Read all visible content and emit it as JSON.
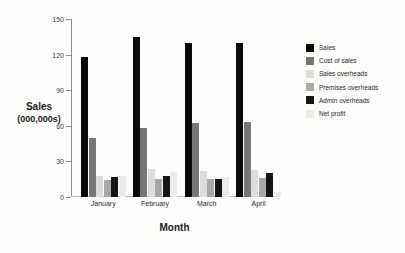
{
  "chart_data": {
    "type": "bar",
    "title": "",
    "xlabel": "Month",
    "ylabel": "Sales",
    "ylabel_line2": "(000,000s)",
    "ylim": [
      0,
      150
    ],
    "yticks": [
      0,
      30,
      60,
      90,
      120,
      150
    ],
    "grid": false,
    "legend_position": "right",
    "categories": [
      "January",
      "February",
      "March",
      "April"
    ],
    "series": [
      {
        "name": "Sales",
        "color": "#0a0a0a",
        "values": [
          118,
          135,
          130,
          130
        ]
      },
      {
        "name": "Cost of sales",
        "color": "#777777",
        "values": [
          50,
          58,
          62,
          63
        ]
      },
      {
        "name": "Sales overheads",
        "color": "#dcdcdc",
        "values": [
          18,
          24,
          22,
          23
        ]
      },
      {
        "name": "Premises overheads",
        "color": "#a8a8a8",
        "values": [
          14,
          15,
          15,
          16
        ]
      },
      {
        "name": "Admin overheads",
        "color": "#151515",
        "values": [
          17,
          18,
          15,
          20
        ]
      },
      {
        "name": "Net profit",
        "color": "#ebebeb",
        "values": [
          18,
          21,
          17,
          4
        ]
      }
    ]
  },
  "axis": {
    "y_title_line1": "Sales",
    "y_title_line2": "(000,000s)",
    "x_title": "Month"
  }
}
